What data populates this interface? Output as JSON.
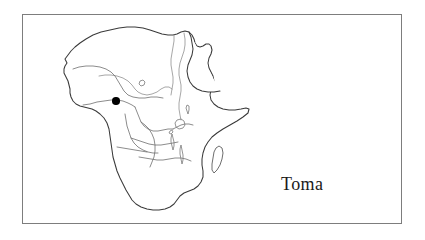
{
  "figure": {
    "type": "locator-map",
    "frame": {
      "border_color": "#7d7d7d",
      "background_color": "#ffffff",
      "left": 22,
      "top": 14,
      "width": 380,
      "height": 210
    }
  },
  "map": {
    "region_name": "Africa",
    "style": "outline-line-art",
    "coastline_color": "#3a3a3a",
    "interior_border_color": "#6e6e6e",
    "water_color": "#8a8a8a",
    "fill_color": "#ffffff"
  },
  "marker": {
    "label": "Toma",
    "shape": "filled-circle",
    "color": "#000000",
    "diameter_px": 7.5,
    "position_px": {
      "x": 86,
      "y": 96
    },
    "region": "West Africa"
  },
  "caption": {
    "text": "Toma",
    "color": "#1a1a1a",
    "font_size_px": 18,
    "position_px": {
      "x": 286,
      "y": 178
    }
  }
}
